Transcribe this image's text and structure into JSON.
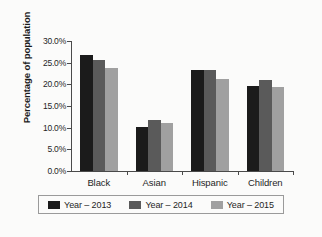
{
  "chart_data": {
    "type": "bar",
    "title": "",
    "xlabel": "",
    "ylabel": "Percentage of population",
    "categories": [
      "Black",
      "Asian",
      "Hispanic",
      "Children"
    ],
    "ylim": [
      0,
      30
    ],
    "ytick_values": [
      0,
      5,
      10,
      15,
      20,
      25,
      30
    ],
    "ytick_labels": [
      "0.0%",
      "5.0%",
      "10.0%",
      "15.0%",
      "20.0%",
      "25.0%",
      "30.0%"
    ],
    "grid": false,
    "legend_position": "bottom",
    "series": [
      {
        "name": "Year – 2013",
        "color": "#1b1b1b",
        "values": [
          26.8,
          10.2,
          23.4,
          19.7
        ]
      },
      {
        "name": "Year – 2014",
        "color": "#5a5a5a",
        "values": [
          25.7,
          11.7,
          23.4,
          21.0
        ]
      },
      {
        "name": "Year – 2015",
        "color": "#a0a0a0",
        "values": [
          23.7,
          11.1,
          21.3,
          19.5
        ]
      }
    ]
  }
}
